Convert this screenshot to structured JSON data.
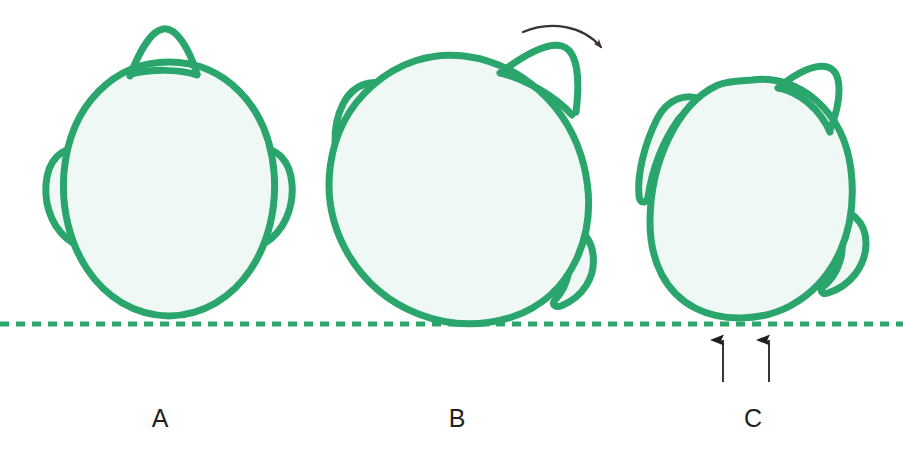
{
  "figure": {
    "kind": "medical-illustration",
    "background_color": "#ffffff",
    "outline_color": "#2aa66d",
    "fill_color": "#f0f8f6",
    "reference_line_color": "#2aa66d",
    "arrow_color": "#3b332f",
    "label_color": "#231f20",
    "panels": [
      {
        "id": "a",
        "label": "A",
        "caption_x": 160,
        "description": "Fetal head upright, occiput anterior, sagittal suture vertical, head above the reference line"
      },
      {
        "id": "b",
        "label": "B",
        "caption_x": 457,
        "description": "Fetal head rotated obliquely, rotation arrow shown at upper right, head touching the reference line"
      },
      {
        "id": "c",
        "label": "C",
        "caption_x": 753,
        "description": "Fetal head fully rotated and flattened against the reference line, two upward arrows indicating pressure"
      }
    ],
    "reference_line": {
      "name": "pelvic-reference-line",
      "y": 324,
      "style": "dashed",
      "dash_length": 9,
      "gap_length": 7,
      "thickness": 5
    },
    "rotation_arrow": {
      "name": "rotation-arrow",
      "panel": "b",
      "direction": "clockwise",
      "color": "#3b332f"
    },
    "pressure_arrows": {
      "name": "pressure-arrows",
      "panel": "c",
      "count": 2,
      "direction": "up",
      "color": "#231f20",
      "x_positions": [
        723,
        769
      ],
      "tail_y": 382,
      "head_y": 340
    }
  }
}
